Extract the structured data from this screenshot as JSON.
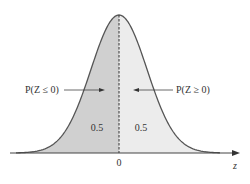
{
  "diagram": {
    "type": "standard-normal-distribution",
    "labels": {
      "left_probability": "P(Z ≤ 0)",
      "right_probability": "P(Z ≥ 0)",
      "left_area": "0.5",
      "right_area": "0.5",
      "center_tick": "0",
      "axis_label": "z"
    },
    "colors": {
      "left_fill": "#d0d0d0",
      "right_fill": "#ececec",
      "curve": "#555555",
      "axis": "#444444"
    }
  }
}
